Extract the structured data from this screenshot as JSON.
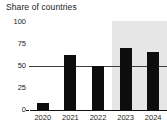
{
  "chart_data": {
    "type": "bar",
    "title": "Share of countries",
    "subtitle": "",
    "xlabel": "",
    "ylabel": "",
    "categories": [
      "2020",
      "2021",
      "2022",
      "2023",
      "2024"
    ],
    "values": [
      8,
      63,
      50,
      70,
      66
    ],
    "series": [
      {
        "name": "Share of countries",
        "values": [
          8,
          63,
          50,
          70,
          66
        ]
      }
    ],
    "ylim": [
      0,
      100
    ],
    "y_ticks": [
      "0",
      "25",
      "50",
      "75",
      "100"
    ],
    "y_tick_values": [
      0,
      25,
      50,
      75,
      100
    ],
    "grid": false,
    "legend": false,
    "legend_position": "none",
    "annotations": [
      {
        "name": "reference-line",
        "type": "hline",
        "value": 50,
        "label": ""
      },
      {
        "name": "highlight-band",
        "type": "vspan",
        "from_category": "2023",
        "to_category": "2024",
        "label": ""
      }
    ],
    "colors": {
      "bar": "#0d0d0d",
      "band": "#e6e6e6",
      "reference_line": "#3d3d3d",
      "axis": "#111111",
      "text": "#1a1a1a",
      "background": "#ffffff"
    }
  }
}
